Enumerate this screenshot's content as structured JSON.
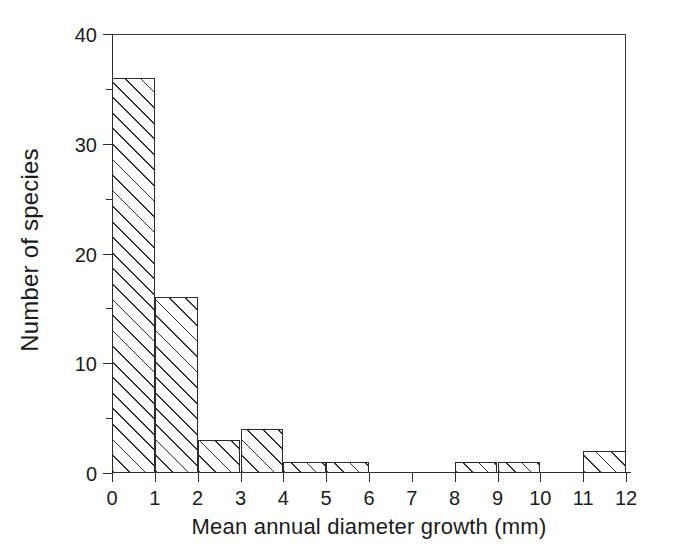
{
  "chart_data": {
    "type": "bar",
    "title": "",
    "xlabel": "Mean annual diameter growth (mm)",
    "ylabel": "Number of species",
    "categories": [
      "0-1",
      "1-2",
      "2-3",
      "3-4",
      "4-5",
      "5-6",
      "6-7",
      "7-8",
      "8-9",
      "9-10",
      "10-11",
      "11-12"
    ],
    "bin_edges": [
      0,
      1,
      2,
      3,
      4,
      5,
      6,
      7,
      8,
      9,
      10,
      11,
      12
    ],
    "values": [
      36,
      16,
      3,
      4,
      1,
      1,
      0,
      0,
      1,
      1,
      0,
      2
    ],
    "xlim": [
      0,
      12
    ],
    "ylim": [
      0,
      40
    ],
    "x_ticks": [
      0,
      1,
      2,
      3,
      4,
      5,
      6,
      7,
      8,
      9,
      10,
      11,
      12
    ],
    "x_tick_labels": [
      "0",
      "1",
      "2",
      "3",
      "4",
      "5",
      "6",
      "7",
      "8",
      "9",
      "10",
      "11",
      "12"
    ],
    "y_ticks": [
      0,
      10,
      20,
      30,
      40
    ],
    "y_tick_labels": [
      "0",
      "10",
      "20",
      "30",
      "40"
    ],
    "y_minor_ticks": [
      5,
      15,
      25,
      35
    ],
    "grid": false,
    "legend": null,
    "bar_style": {
      "fill": "diagonal-hatch",
      "edge_color": "#2b2b2b",
      "face_color": "#ffffff"
    },
    "frame": {
      "top": true,
      "right": true,
      "left": true,
      "bottom": true
    }
  },
  "figure": {
    "background": "#ffffff",
    "text_color": "#1b1b1b"
  }
}
